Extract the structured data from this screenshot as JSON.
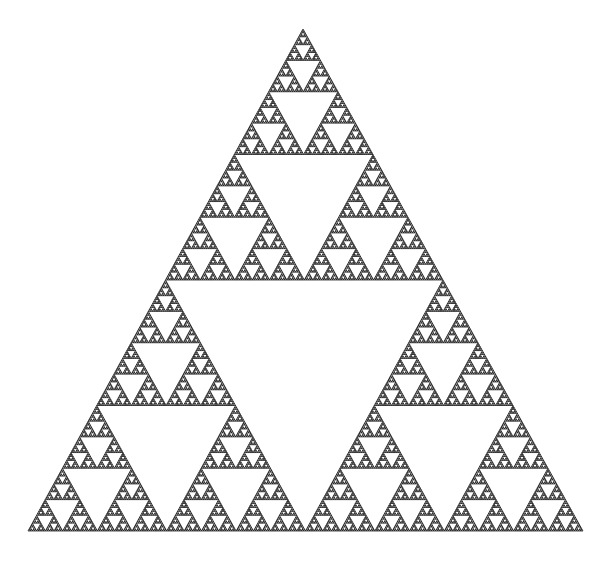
{
  "figure": {
    "background_color": "#ffffff",
    "stroke_color": "#000000",
    "stroke_width": 0.7,
    "depth": 8,
    "vertices": {
      "apex": [
        303,
        29
      ],
      "bottom_left": [
        28,
        531
      ],
      "bottom_right": [
        583,
        531
      ]
    }
  }
}
